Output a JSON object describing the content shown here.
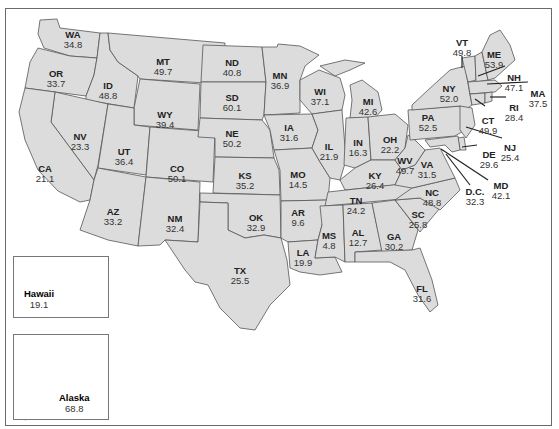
{
  "map": {
    "frame_color": "#6a6a6a",
    "fill_color": "#dcdcdc",
    "states": [
      {
        "abbr": "WA",
        "value": "34.8",
        "x": 73,
        "y": 38
      },
      {
        "abbr": "OR",
        "value": "33.7",
        "x": 56,
        "y": 77
      },
      {
        "abbr": "ID",
        "value": "48.8",
        "x": 108,
        "y": 89
      },
      {
        "abbr": "MT",
        "value": "49.7",
        "x": 163,
        "y": 65
      },
      {
        "abbr": "WY",
        "value": "39.4",
        "x": 165,
        "y": 118
      },
      {
        "abbr": "NV",
        "value": "23.3",
        "x": 80,
        "y": 140
      },
      {
        "abbr": "UT",
        "value": "36.4",
        "x": 124,
        "y": 155
      },
      {
        "abbr": "CO",
        "value": "50.1",
        "x": 177,
        "y": 172
      },
      {
        "abbr": "CA",
        "value": "21.1",
        "x": 45,
        "y": 172
      },
      {
        "abbr": "AZ",
        "value": "33.2",
        "x": 113,
        "y": 215
      },
      {
        "abbr": "NM",
        "value": "32.4",
        "x": 175,
        "y": 222
      },
      {
        "abbr": "ND",
        "value": "40.8",
        "x": 232,
        "y": 66
      },
      {
        "abbr": "SD",
        "value": "60.1",
        "x": 232,
        "y": 101
      },
      {
        "abbr": "NE",
        "value": "50.2",
        "x": 232,
        "y": 137
      },
      {
        "abbr": "KS",
        "value": "35.2",
        "x": 245,
        "y": 179
      },
      {
        "abbr": "OK",
        "value": "32.9",
        "x": 256,
        "y": 221
      },
      {
        "abbr": "TX",
        "value": "25.5",
        "x": 240,
        "y": 274
      },
      {
        "abbr": "MN",
        "value": "36.9",
        "x": 280,
        "y": 79
      },
      {
        "abbr": "IA",
        "value": "31.6",
        "x": 289,
        "y": 131
      },
      {
        "abbr": "MO",
        "value": "14.5",
        "x": 298,
        "y": 178
      },
      {
        "abbr": "AR",
        "value": "9.6",
        "x": 298,
        "y": 216
      },
      {
        "abbr": "LA",
        "value": "19.9",
        "x": 303,
        "y": 256
      },
      {
        "abbr": "WI",
        "value": "37.1",
        "x": 320,
        "y": 95
      },
      {
        "abbr": "IL",
        "value": "21.9",
        "x": 329,
        "y": 150
      },
      {
        "abbr": "MS",
        "value": "4.8",
        "x": 329,
        "y": 239
      },
      {
        "abbr": "MI",
        "value": "42.6",
        "x": 368,
        "y": 105
      },
      {
        "abbr": "IN",
        "value": "16.3",
        "x": 358,
        "y": 146
      },
      {
        "abbr": "KY",
        "value": "26.4",
        "x": 375,
        "y": 179
      },
      {
        "abbr": "TN",
        "value": "24.2",
        "x": 356,
        "y": 204
      },
      {
        "abbr": "AL",
        "value": "12.7",
        "x": 358,
        "y": 236
      },
      {
        "abbr": "OH",
        "value": "22.2",
        "x": 390,
        "y": 143
      },
      {
        "abbr": "WV",
        "value": "49.7",
        "x": 405,
        "y": 164
      },
      {
        "abbr": "VA",
        "value": "31.5",
        "x": 427,
        "y": 168
      },
      {
        "abbr": "NC",
        "value": "48.8",
        "x": 432,
        "y": 196
      },
      {
        "abbr": "SC",
        "value": "25.8",
        "x": 418,
        "y": 218
      },
      {
        "abbr": "GA",
        "value": "30.2",
        "x": 394,
        "y": 240
      },
      {
        "abbr": "FL",
        "value": "31.6",
        "x": 422,
        "y": 292
      },
      {
        "abbr": "PA",
        "value": "52.5",
        "x": 428,
        "y": 121
      },
      {
        "abbr": "NY",
        "value": "52.0",
        "x": 449,
        "y": 92
      },
      {
        "abbr": "VT",
        "value": "49.8",
        "x": 462,
        "y": 46
      },
      {
        "abbr": "ME",
        "value": "53.9",
        "x": 494,
        "y": 58
      },
      {
        "abbr": "NH",
        "value": "47.1",
        "x": 514,
        "y": 81
      },
      {
        "abbr": "MA",
        "value": "37.5",
        "x": 538,
        "y": 97
      },
      {
        "abbr": "RI",
        "value": "28.4",
        "x": 514,
        "y": 111
      },
      {
        "abbr": "CT",
        "value": "49.9",
        "x": 488,
        "y": 124
      },
      {
        "abbr": "NJ",
        "value": "25.4",
        "x": 510,
        "y": 151
      },
      {
        "abbr": "DE",
        "value": "29.6",
        "x": 489,
        "y": 158
      },
      {
        "abbr": "MD",
        "value": "42.1",
        "x": 501,
        "y": 189
      },
      {
        "abbr": "D.C.",
        "value": "32.3",
        "x": 475,
        "y": 195
      }
    ],
    "insets": [
      {
        "name": "Hawaii",
        "value": "19.1"
      },
      {
        "name": "Alaska",
        "value": "68.8"
      }
    ]
  }
}
